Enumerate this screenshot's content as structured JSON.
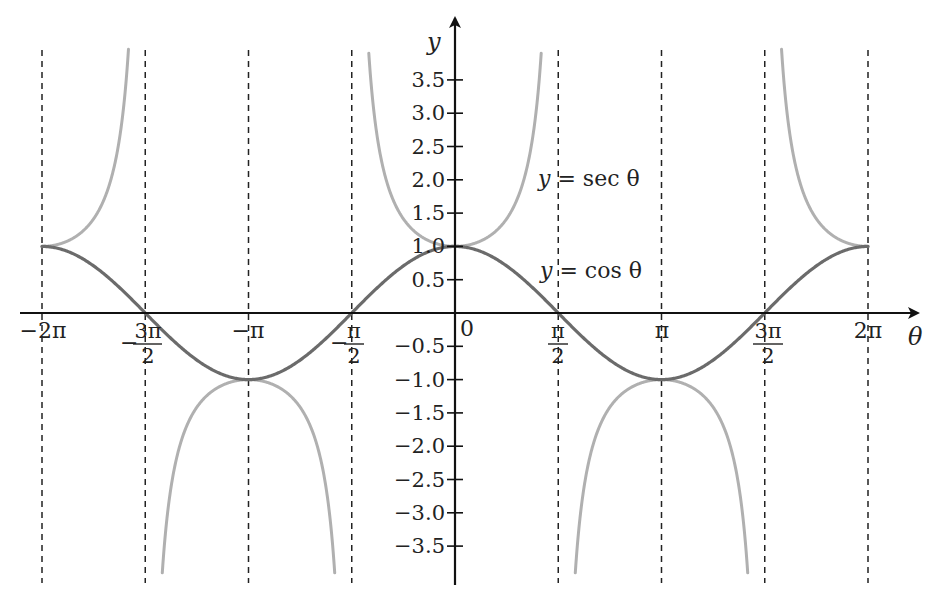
{
  "chart_data": {
    "type": "line",
    "title": "",
    "xlabel": "θ",
    "ylabel": "y",
    "x_ticks": [
      "−2π",
      "−3π/2",
      "−π",
      "−π/2",
      "0",
      "π/2",
      "π",
      "3π/2",
      "2π"
    ],
    "x_tick_values": [
      -6.2832,
      -4.7124,
      -3.1416,
      -1.5708,
      0,
      1.5708,
      3.1416,
      4.7124,
      6.2832
    ],
    "y_ticks": [
      "3.5",
      "3.0",
      "2.5",
      "2.0",
      "1.5",
      "1.0",
      "0.5",
      "−0.5",
      "−1.0",
      "−1.5",
      "−2.0",
      "−2.5",
      "−3.0",
      "−3.5"
    ],
    "y_tick_values": [
      3.5,
      3.0,
      2.5,
      2.0,
      1.5,
      1.0,
      0.5,
      -0.5,
      -1.0,
      -1.5,
      -2.0,
      -2.5,
      -3.0,
      -3.5
    ],
    "xlim": [
      -6.2832,
      6.2832
    ],
    "ylim": [
      -4.0,
      4.0
    ],
    "asymptotes": [
      "−3π/2",
      "−π/2",
      "π/2",
      "3π/2"
    ],
    "dashed_guides": [
      "−2π",
      "−3π/2",
      "−π",
      "−π/2",
      "π/2",
      "π",
      "3π/2",
      "2π"
    ],
    "grid": false,
    "series": [
      {
        "name": "y = cos θ",
        "function": "cos",
        "color": "#6b6b6b",
        "points": [
          {
            "x": "−2π",
            "y": 1
          },
          {
            "x": "−3π/2",
            "y": 0
          },
          {
            "x": "−π",
            "y": -1
          },
          {
            "x": "−π/2",
            "y": 0
          },
          {
            "x": "0",
            "y": 1
          },
          {
            "x": "π/2",
            "y": 0
          },
          {
            "x": "π",
            "y": -1
          },
          {
            "x": "3π/2",
            "y": 0
          },
          {
            "x": "2π",
            "y": 1
          }
        ]
      },
      {
        "name": "y = sec θ",
        "function": "sec",
        "color": "#b0b0b0",
        "points": [
          {
            "x": "−2π",
            "y": 1
          },
          {
            "x": "−π",
            "y": -1
          },
          {
            "x": "0",
            "y": 1
          },
          {
            "x": "π",
            "y": -1
          },
          {
            "x": "2π",
            "y": 1
          }
        ]
      }
    ],
    "annotations": [
      {
        "text": "y = sec θ",
        "near": "π/2, 2.0"
      },
      {
        "text": "y = cos θ",
        "near": "π/2, 0.6"
      }
    ]
  },
  "labels": {
    "y_axis": "y",
    "x_axis": "θ",
    "origin": "0",
    "sec_label_var": "y",
    "sec_label_rest": " = sec θ",
    "cos_label_var": "y",
    "cos_label_rest": " = cos θ",
    "x_neg2pi": "−2π",
    "x_negpi": "−π",
    "x_pi": "π",
    "x_2pi": "2π",
    "frac_3pi": "3π",
    "frac_pi": "π",
    "frac_den": "2",
    "neg_sign": "−"
  },
  "colors": {
    "cos": "#6b6b6b",
    "sec": "#b0b0b0",
    "axis": "#111111",
    "guide": "#222222"
  }
}
